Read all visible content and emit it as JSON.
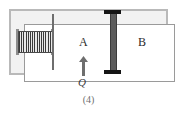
{
  "figure": {
    "caption": "(4)",
    "type": "physics-apparatus-diagram"
  },
  "vessel": {
    "name": "cylinder",
    "wall_color": "#b9b9b9",
    "interior_color": "#ffffff"
  },
  "components": {
    "spring": {
      "label": "",
      "icon": "coil-spring-icon",
      "color": "#3a3a3a"
    },
    "inner_wall": {
      "label": "",
      "icon": "partition-wall-icon",
      "color": "#6e6e6e"
    },
    "piston": {
      "label": "",
      "icon": "piston-rod-icon",
      "rod_color": "#5c5c5c",
      "cap_color": "#151515"
    }
  },
  "chambers": [
    {
      "id": "a",
      "label": "A"
    },
    {
      "id": "b",
      "label": "B"
    }
  ],
  "heat": {
    "label": "Q",
    "direction": "up",
    "icon": "up-arrow-icon",
    "color": "#6e6e6e"
  }
}
